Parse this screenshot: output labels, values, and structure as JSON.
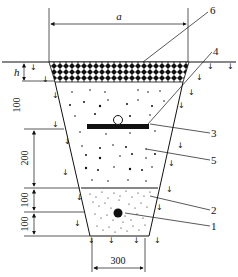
{
  "diagram": {
    "type": "trench cross-section",
    "dimensions": {
      "top_width": "a",
      "cover_depth": "h",
      "upper_fill": "100",
      "middle_fill": "200",
      "sand_upper": "100",
      "sand_lower": "100",
      "bottom_width": "300"
    },
    "callouts": [
      {
        "id": "1",
        "label": "1"
      },
      {
        "id": "2",
        "label": "2"
      },
      {
        "id": "3",
        "label": "3"
      },
      {
        "id": "4",
        "label": "4"
      },
      {
        "id": "5",
        "label": "5"
      },
      {
        "id": "6",
        "label": "6"
      }
    ],
    "colors": {
      "line": "#111111",
      "background": "#ffffff"
    }
  }
}
